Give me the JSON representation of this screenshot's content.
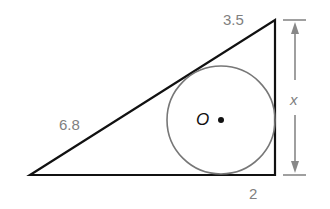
{
  "diagram": {
    "type": "triangle-with-inscribed-circle",
    "labels": {
      "top_segment": "3.5",
      "hypotenuse_segment": "6.8",
      "bottom_segment": "2",
      "height": "x",
      "center": "O"
    },
    "colors": {
      "triangle_stroke": "#111111",
      "circle_stroke": "#777777",
      "dimension": "#888888",
      "label": "#808080"
    }
  }
}
